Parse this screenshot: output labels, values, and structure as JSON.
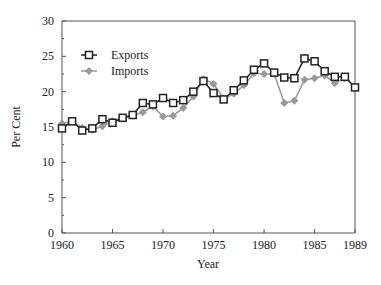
{
  "chart_data": {
    "type": "line",
    "title": "",
    "xlabel": "Year",
    "ylabel": "Per Cent",
    "xlim": [
      1960,
      1989
    ],
    "ylim": [
      0,
      30
    ],
    "x_ticks": [
      1960,
      1965,
      1970,
      1975,
      1980,
      1985,
      1989
    ],
    "y_ticks": [
      0,
      5,
      10,
      15,
      20,
      25,
      30
    ],
    "grid": false,
    "legend_position": "upper-left",
    "x": [
      1960,
      1961,
      1962,
      1963,
      1964,
      1965,
      1966,
      1967,
      1968,
      1969,
      1970,
      1971,
      1972,
      1973,
      1974,
      1975,
      1976,
      1977,
      1978,
      1979,
      1980,
      1981,
      1982,
      1983,
      1984,
      1985,
      1986,
      1987,
      1988,
      1989
    ],
    "series": [
      {
        "name": "Exports",
        "marker": "open-square",
        "color": "#222222",
        "values": [
          14.8,
          15.8,
          14.5,
          14.8,
          16.1,
          15.6,
          16.3,
          16.7,
          18.4,
          18.2,
          19.1,
          18.4,
          18.8,
          20.0,
          21.5,
          19.8,
          18.9,
          20.2,
          21.6,
          23.1,
          24.0,
          22.7,
          22.0,
          21.9,
          24.7,
          24.3,
          22.9,
          22.1,
          22.1,
          20.6
        ]
      },
      {
        "name": "Imports",
        "marker": "filled-diamond",
        "color": "#999999",
        "values": [
          15.5,
          15.8,
          14.9,
          14.6,
          15.1,
          15.8,
          16.3,
          16.6,
          17.1,
          17.9,
          16.5,
          16.6,
          17.7,
          19.3,
          21.8,
          21.1,
          19.0,
          19.7,
          20.9,
          22.6,
          22.5,
          22.5,
          18.4,
          18.7,
          21.7,
          21.9,
          22.3,
          21.2,
          21.9,
          20.7
        ]
      }
    ]
  }
}
